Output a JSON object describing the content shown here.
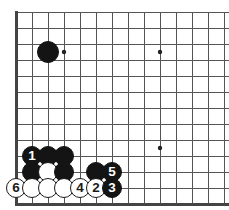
{
  "board": {
    "type": "go-board-diagram",
    "background_color": "#ffffff",
    "line_color": "#555555",
    "border_color": "#444444",
    "black_color": "#141414",
    "white_color": "#ffffff",
    "grid_spacing": 16,
    "origin_x": 16,
    "origin_y": 12,
    "cols": 14,
    "rows": 12,
    "border": {
      "left": true,
      "bottom": true,
      "top": false,
      "right": false
    },
    "star_points": [
      {
        "col": 3,
        "row": 2.5,
        "cx": 64,
        "cy": 52
      },
      {
        "col": 9,
        "row": 2.5,
        "cx": 160,
        "cy": 52
      },
      {
        "col": 9,
        "row": 8.5,
        "cx": 160,
        "cy": 148
      }
    ],
    "stones": [
      {
        "id": "b-corner-approach",
        "color": "black",
        "label": "",
        "cx": 48,
        "cy": 52,
        "r": 11
      },
      {
        "id": "b-1",
        "color": "black",
        "label": "1",
        "cx": 32,
        "cy": 156,
        "r": 10
      },
      {
        "id": "b-a",
        "color": "black",
        "label": "",
        "cx": 48,
        "cy": 156,
        "r": 10
      },
      {
        "id": "b-b",
        "color": "black",
        "label": "",
        "cx": 64,
        "cy": 156,
        "r": 10
      },
      {
        "id": "b-c",
        "color": "black",
        "label": "",
        "cx": 32,
        "cy": 172,
        "r": 10
      },
      {
        "id": "w-a",
        "color": "white",
        "label": "",
        "cx": 48,
        "cy": 172,
        "r": 10
      },
      {
        "id": "b-d",
        "color": "black",
        "label": "",
        "cx": 64,
        "cy": 172,
        "r": 10
      },
      {
        "id": "b-e",
        "color": "black",
        "label": "",
        "cx": 96,
        "cy": 172,
        "r": 10
      },
      {
        "id": "b-5",
        "color": "black",
        "label": "5",
        "cx": 112,
        "cy": 172,
        "r": 10
      },
      {
        "id": "w-6",
        "color": "white",
        "label": "6",
        "cx": 16,
        "cy": 188,
        "r": 10
      },
      {
        "id": "w-b",
        "color": "white",
        "label": "",
        "cx": 32,
        "cy": 188,
        "r": 10
      },
      {
        "id": "w-c",
        "color": "white",
        "label": "",
        "cx": 48,
        "cy": 188,
        "r": 10
      },
      {
        "id": "w-d",
        "color": "white",
        "label": "",
        "cx": 64,
        "cy": 188,
        "r": 10
      },
      {
        "id": "w-4",
        "color": "white",
        "label": "4",
        "cx": 80,
        "cy": 188,
        "r": 10
      },
      {
        "id": "w-2",
        "color": "white",
        "label": "2",
        "cx": 96,
        "cy": 188,
        "r": 10
      },
      {
        "id": "b-3",
        "color": "black",
        "label": "3",
        "cx": 112,
        "cy": 188,
        "r": 10
      }
    ]
  }
}
